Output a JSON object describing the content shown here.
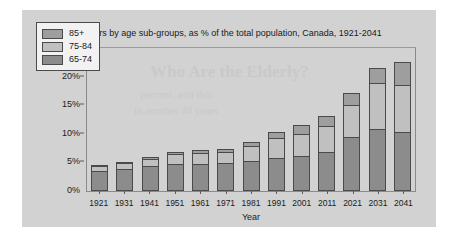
{
  "chart_data": {
    "type": "bar",
    "subtype": "stacked-bar",
    "title": "Seniors by age sub-groups, as % of the total population, Canada, 1921-2041",
    "xlabel": "Year",
    "ylabel": "",
    "categories": [
      "1921",
      "1931",
      "1941",
      "1951",
      "1961",
      "1971",
      "1981",
      "1991",
      "2001",
      "2011",
      "2021",
      "2031",
      "2041"
    ],
    "ylim": [
      0,
      25
    ],
    "yticks": [
      0,
      5,
      10,
      15,
      20,
      25
    ],
    "ytick_labels": [
      "0%",
      "5%",
      "10%",
      "15%",
      "20%",
      "25%"
    ],
    "grid": false,
    "legend_position": "top-left",
    "stack_order_bottom_to_top": [
      "65-74",
      "75-84",
      "85+"
    ],
    "series": [
      {
        "name": "65-74",
        "color": "#8c8c8c",
        "values": [
          3.5,
          3.9,
          4.3,
          4.8,
          4.8,
          4.9,
          5.3,
          5.8,
          6.1,
          6.8,
          9.4,
          10.9,
          10.4
        ]
      },
      {
        "name": "75-84",
        "color": "#c0c0c0",
        "values": [
          0.9,
          1.0,
          1.3,
          1.7,
          1.9,
          1.9,
          2.6,
          3.4,
          3.9,
          4.5,
          5.7,
          8.0,
          8.2
        ]
      },
      {
        "name": "85+",
        "color": "#9e9e9e",
        "values": [
          0.2,
          0.2,
          0.3,
          0.4,
          0.4,
          0.5,
          0.7,
          1.2,
          1.5,
          1.9,
          2.0,
          2.6,
          3.9
        ]
      }
    ],
    "totals": [
      4.6,
      5.1,
      5.9,
      6.9,
      7.1,
      7.3,
      8.6,
      10.4,
      11.5,
      13.2,
      17.1,
      21.5,
      22.5
    ]
  },
  "legend": {
    "items": [
      {
        "label": "85+",
        "color": "#9e9e9e"
      },
      {
        "label": "75-84",
        "color": "#c0c0c0"
      },
      {
        "label": "65-74",
        "color": "#8c8c8c"
      }
    ]
  },
  "background": {
    "card_color": "#d2d2d2",
    "page_color": "#ffffff",
    "bleed_title": "Who Are the Elderly?",
    "bleed_sub1": "percent, and this",
    "bleed_sub2": "in another 40 years"
  }
}
